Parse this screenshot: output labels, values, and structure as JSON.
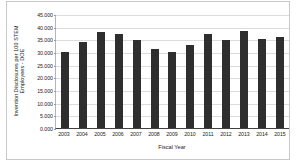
{
  "chart_data": {
    "type": "bar",
    "title": "",
    "xlabel": "Fiscal Year",
    "ylabel": "Invention Disclosures per 100 STEM Employees - DOE",
    "ylabel_lines": [
      "Invention Disclosures per 100 STEM",
      "Employees - DOE"
    ],
    "categories": [
      "2003",
      "2004",
      "2005",
      "2006",
      "2007",
      "2008",
      "2009",
      "2010",
      "2011",
      "2012",
      "2013",
      "2014",
      "2015"
    ],
    "values": [
      29.9,
      34.1,
      37.9,
      37.0,
      34.9,
      31.2,
      29.9,
      32.7,
      37.0,
      34.9,
      38.4,
      35.3,
      36.1
    ],
    "ylim": [
      0,
      45
    ],
    "ytick_labels": [
      "45.000",
      "40.000",
      "35.000",
      "30.000",
      "25.000",
      "20.000",
      "15.000",
      "10.000",
      "5.000",
      "0.000"
    ],
    "ytick_values": [
      45,
      40,
      35,
      30,
      25,
      20,
      15,
      10,
      5,
      0
    ],
    "grid": true,
    "legend": "none",
    "bar_color": "#2e2e2e",
    "gridline_color": "#dcdcdc",
    "axis_color": "#404040",
    "background_color": "#ffffff"
  }
}
